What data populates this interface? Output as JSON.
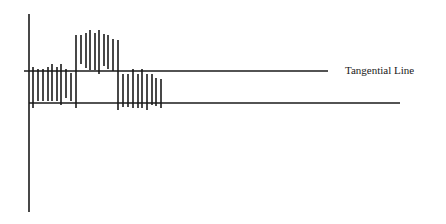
{
  "diagram": {
    "stroke_color": "#1a1a1a",
    "background": "#ffffff",
    "tangential_line": {
      "label": "Tangential Line",
      "y": 71,
      "x1": 24,
      "x2": 328,
      "label_x": 345,
      "label_y": 64
    },
    "baseline": {
      "y": 103,
      "x1": 29,
      "x2": 400
    },
    "vertical_axis": {
      "x": 29,
      "y1": 14,
      "y2": 212
    },
    "groups": [
      {
        "name": "group-below-1",
        "bars": [
          {
            "x": 33,
            "y1": 67,
            "y2": 108
          },
          {
            "x": 38,
            "y1": 69,
            "y2": 101
          },
          {
            "x": 43,
            "y1": 69,
            "y2": 101
          },
          {
            "x": 48,
            "y1": 67,
            "y2": 101
          },
          {
            "x": 52,
            "y1": 64,
            "y2": 101
          },
          {
            "x": 57,
            "y1": 67,
            "y2": 101
          },
          {
            "x": 61,
            "y1": 64,
            "y2": 105
          },
          {
            "x": 66,
            "y1": 69,
            "y2": 98
          },
          {
            "x": 71,
            "y1": 73,
            "y2": 101
          },
          {
            "x": 76,
            "y1": 71,
            "y2": 108
          }
        ]
      },
      {
        "name": "group-above",
        "bars": [
          {
            "x": 76,
            "y1": 35,
            "y2": 71
          },
          {
            "x": 81,
            "y1": 35,
            "y2": 64
          },
          {
            "x": 86,
            "y1": 33,
            "y2": 68
          },
          {
            "x": 90,
            "y1": 30,
            "y2": 70
          },
          {
            "x": 95,
            "y1": 33,
            "y2": 70
          },
          {
            "x": 99,
            "y1": 30,
            "y2": 74
          },
          {
            "x": 104,
            "y1": 34,
            "y2": 66
          },
          {
            "x": 108,
            "y1": 35,
            "y2": 69
          },
          {
            "x": 113,
            "y1": 39,
            "y2": 71
          },
          {
            "x": 118,
            "y1": 40,
            "y2": 71
          }
        ]
      },
      {
        "name": "group-below-2",
        "bars": [
          {
            "x": 118,
            "y1": 71,
            "y2": 110
          },
          {
            "x": 123,
            "y1": 74,
            "y2": 107
          },
          {
            "x": 128,
            "y1": 74,
            "y2": 107
          },
          {
            "x": 133,
            "y1": 69,
            "y2": 108
          },
          {
            "x": 138,
            "y1": 74,
            "y2": 108
          },
          {
            "x": 142,
            "y1": 69,
            "y2": 108
          },
          {
            "x": 147,
            "y1": 74,
            "y2": 110
          },
          {
            "x": 152,
            "y1": 74,
            "y2": 105
          },
          {
            "x": 156,
            "y1": 78,
            "y2": 106
          },
          {
            "x": 161,
            "y1": 79,
            "y2": 108
          }
        ]
      }
    ]
  }
}
